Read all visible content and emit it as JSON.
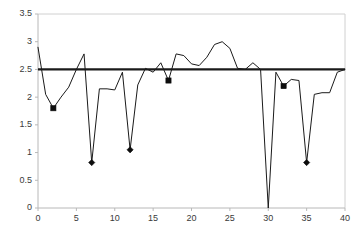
{
  "chart_data": {
    "type": "line",
    "title": "",
    "xlabel": "",
    "ylabel": "",
    "xlim": [
      0,
      40
    ],
    "ylim": [
      0,
      3.5
    ],
    "xticks": [
      0,
      5,
      10,
      15,
      20,
      25,
      30,
      35,
      40
    ],
    "ytick_labels": [
      "0",
      "0.5",
      "1",
      "1.5",
      "2",
      "2.5",
      "3",
      "3.5"
    ],
    "yticks": [
      0,
      0.5,
      1,
      1.5,
      2,
      2.5,
      3,
      3.5
    ],
    "grid": false,
    "legend": null,
    "colors": {
      "series": "#1a1a1a",
      "reference": "#1a1a1a",
      "marker": "#0d0d0d",
      "axis": "#b8b8b8",
      "frame": "#d0d0d0",
      "text": "#3a3a3a",
      "background": "#ffffff"
    },
    "reference_line": {
      "name": "threshold",
      "orientation": "horizontal",
      "value": 2.5
    },
    "series": [
      {
        "name": "series-1",
        "x": [
          0,
          1,
          2,
          3,
          4,
          5,
          6,
          7,
          8,
          9,
          10,
          11,
          12,
          13,
          14,
          15,
          16,
          17,
          18,
          19,
          20,
          21,
          22,
          23,
          24,
          25,
          26,
          27,
          28,
          29,
          30,
          31,
          32,
          33,
          34,
          35,
          36,
          37,
          38,
          39,
          40
        ],
        "values": [
          2.9,
          2.05,
          1.8,
          2.0,
          2.18,
          2.5,
          2.78,
          0.82,
          2.15,
          2.15,
          2.13,
          2.45,
          1.05,
          2.22,
          2.52,
          2.45,
          2.62,
          2.3,
          2.78,
          2.75,
          2.6,
          2.57,
          2.72,
          2.95,
          3.0,
          2.88,
          2.52,
          2.5,
          2.62,
          2.5,
          0.0,
          2.45,
          2.2,
          2.32,
          2.3,
          0.82,
          2.05,
          2.08,
          2.08,
          2.45,
          2.5
        ]
      }
    ],
    "markers": [
      {
        "x": 2,
        "y": 1.8,
        "shape": "square"
      },
      {
        "x": 7,
        "y": 0.82,
        "shape": "diamond"
      },
      {
        "x": 12,
        "y": 1.05,
        "shape": "diamond"
      },
      {
        "x": 17,
        "y": 2.3,
        "shape": "square"
      },
      {
        "x": 32,
        "y": 2.2,
        "shape": "square"
      },
      {
        "x": 35,
        "y": 0.82,
        "shape": "diamond"
      }
    ]
  },
  "plot_geometry": {
    "left": 38,
    "right": 345,
    "top": 14,
    "bottom": 208
  }
}
